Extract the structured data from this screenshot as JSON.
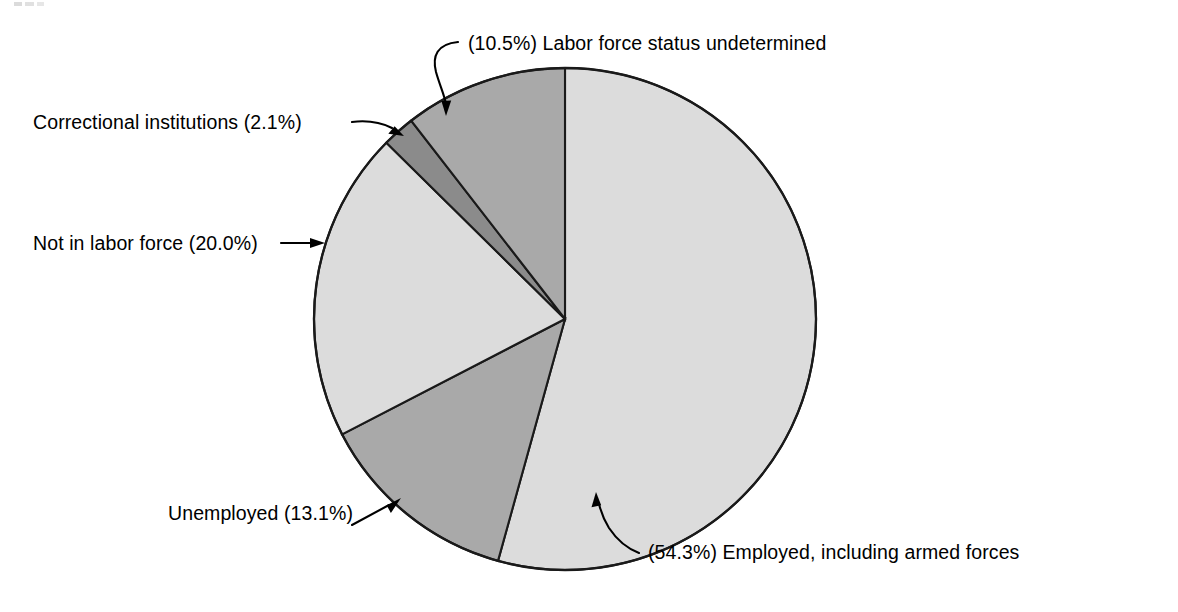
{
  "chart_data": {
    "type": "pie",
    "title": "",
    "subtitle": "",
    "xlabel": "",
    "ylabel": "",
    "grid": false,
    "legend_position": "none",
    "label_style": "callout labels with leader lines",
    "units": "percent",
    "total": 100.0,
    "start_angle_deg": 0,
    "direction": "clockwise",
    "categories": [
      "Employed, including armed forces",
      "Unemployed",
      "Not in labor force",
      "Correctional institutions",
      "Labor force status undetermined"
    ],
    "values": [
      54.3,
      13.1,
      20.0,
      2.1,
      10.5
    ],
    "slices": [
      {
        "label": "Employed, including armed forces",
        "value": 54.3,
        "value_text": "54.3%",
        "callout_text": "(54.3%) Employed, including armed forces",
        "label_position": "bottom-right",
        "fill": "#dcdcdc"
      },
      {
        "label": "Unemployed",
        "value": 13.1,
        "value_text": "13.1%",
        "callout_text": "Unemployed (13.1%)",
        "label_position": "bottom-left",
        "fill": "#a9a9a9"
      },
      {
        "label": "Not in labor force",
        "value": 20.0,
        "value_text": "20.0%",
        "callout_text": "Not in labor force (20.0%)",
        "label_position": "left",
        "fill": "#dcdcdc"
      },
      {
        "label": "Correctional institutions",
        "value": 2.1,
        "value_text": "2.1%",
        "callout_text": "Correctional institutions (2.1%)",
        "label_position": "upper-left",
        "fill": "#8b8b8b"
      },
      {
        "label": "Labor force status undetermined",
        "value": 10.5,
        "value_text": "10.5%",
        "callout_text": "(10.5%) Labor force status undetermined",
        "label_position": "top",
        "fill": "#a9a9a9"
      }
    ],
    "colors": {
      "light_gray": "#dcdcdc",
      "medium_gray": "#a9a9a9",
      "dark_gray": "#8b8b8b",
      "outline": "#1a1a1a",
      "text": "#000000",
      "background": "#ffffff"
    }
  }
}
